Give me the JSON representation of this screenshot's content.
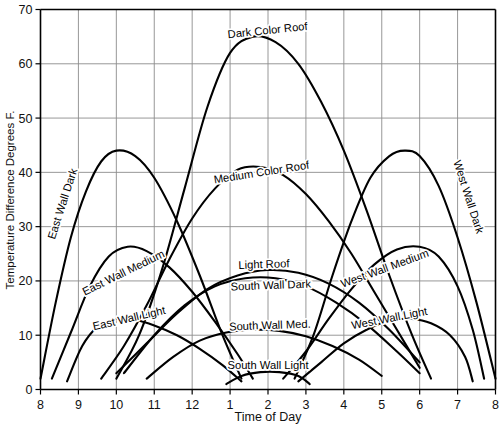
{
  "chart_data": {
    "type": "line",
    "title": "",
    "xlabel": "Time of Day",
    "ylabel": "Temperature Difference Degrees F.",
    "xlim": [
      8,
      20
    ],
    "ylim": [
      0,
      70
    ],
    "grid": true,
    "legend": "inline-curve-labels",
    "x_tick_labels": [
      "8",
      "9",
      "10",
      "11",
      "12",
      "1",
      "2",
      "3",
      "4",
      "5",
      "6",
      "7",
      "8"
    ],
    "x_tick_values": [
      8,
      9,
      10,
      11,
      12,
      13,
      14,
      15,
      16,
      17,
      18,
      19,
      20
    ],
    "y_tick_labels": [
      "0",
      "10",
      "20",
      "30",
      "40",
      "50",
      "60",
      "70"
    ],
    "y_tick_values": [
      0,
      10,
      20,
      30,
      40,
      50,
      60,
      70
    ],
    "series": [
      {
        "name": "Dark Color Roof",
        "label": "Dark Color Roof",
        "x": [
          10.0,
          10.6,
          11.2,
          11.8,
          12.4,
          13.0,
          13.6,
          14.2,
          14.8,
          15.4,
          16.0,
          16.6,
          17.2,
          17.8,
          18.3
        ],
        "values": [
          2.0,
          10.0,
          22.0,
          37.0,
          52.0,
          62.0,
          65.0,
          64.0,
          60.0,
          53.0,
          44.0,
          33.0,
          21.0,
          10.0,
          2.0
        ]
      },
      {
        "name": "Medium Color Roof",
        "label": "Medium Color Roof",
        "x": [
          9.6,
          10.2,
          10.8,
          11.4,
          12.0,
          12.6,
          13.2,
          13.8,
          14.4,
          15.0,
          15.6,
          16.2,
          16.8,
          17.4,
          18.0
        ],
        "values": [
          2.0,
          8.0,
          15.5,
          24.0,
          31.5,
          37.0,
          40.5,
          41.0,
          39.5,
          36.0,
          31.0,
          25.0,
          18.0,
          11.0,
          4.0
        ]
      },
      {
        "name": "Light Roof",
        "label": "Light Roof",
        "x": [
          10.0,
          10.8,
          11.6,
          12.4,
          13.2,
          14.0,
          14.8,
          15.6,
          16.4,
          17.2,
          18.0
        ],
        "values": [
          3.0,
          8.5,
          14.0,
          18.5,
          21.0,
          22.0,
          21.5,
          19.5,
          16.0,
          11.0,
          5.0
        ]
      },
      {
        "name": "East Wall Dark",
        "label": "East Wall Dark",
        "x": [
          8.0,
          8.4,
          8.8,
          9.2,
          9.6,
          10.0,
          10.5,
          11.0,
          11.6,
          12.2,
          12.8,
          13.3
        ],
        "values": [
          2.0,
          16.0,
          28.0,
          36.5,
          42.0,
          44.0,
          43.0,
          39.0,
          31.0,
          21.0,
          10.0,
          2.0
        ]
      },
      {
        "name": "East Wall Medium",
        "label": "East Wall Medium",
        "x": [
          8.3,
          8.8,
          9.3,
          9.8,
          10.3,
          10.8,
          11.4,
          12.0,
          12.6,
          13.2,
          13.6
        ],
        "values": [
          2.0,
          10.5,
          19.0,
          24.5,
          26.3,
          25.5,
          22.5,
          18.0,
          12.5,
          6.5,
          2.0
        ]
      },
      {
        "name": "East Wall Light",
        "label": "East Wall Light",
        "x": [
          8.7,
          9.1,
          9.5,
          10.0,
          10.5,
          11.0,
          11.6,
          12.2,
          12.8,
          13.3
        ],
        "values": [
          1.5,
          8.0,
          11.5,
          13.0,
          12.8,
          11.8,
          10.0,
          7.5,
          4.5,
          1.5
        ]
      },
      {
        "name": "South Wall Dark",
        "label": "South Wall Dark",
        "x": [
          10.2,
          11.0,
          11.8,
          12.6,
          13.4,
          14.2,
          15.0,
          15.8,
          16.6,
          17.4,
          18.0
        ],
        "values": [
          3.0,
          10.0,
          15.5,
          19.0,
          20.5,
          20.5,
          19.0,
          16.0,
          12.0,
          7.0,
          3.0
        ]
      },
      {
        "name": "South Wall Med.",
        "label": "South Wall Med.",
        "x": [
          10.8,
          11.5,
          12.2,
          12.9,
          13.6,
          14.3,
          15.0,
          15.7,
          16.4,
          17.0
        ],
        "values": [
          2.0,
          6.0,
          9.0,
          10.5,
          11.0,
          10.8,
          9.8,
          8.0,
          5.5,
          2.5
        ]
      },
      {
        "name": "South Wall Light",
        "label": "South Wall Light",
        "x": [
          12.9,
          13.3,
          13.8,
          14.3,
          14.8,
          15.1
        ],
        "values": [
          1.0,
          2.5,
          3.2,
          3.2,
          2.5,
          1.0
        ]
      },
      {
        "name": "West Wall Dark",
        "label": "West Wall Dark",
        "x": [
          14.7,
          15.2,
          15.7,
          16.2,
          16.7,
          17.2,
          17.6,
          18.0,
          18.5,
          19.0,
          19.5,
          20.0
        ],
        "values": [
          2.0,
          10.0,
          21.0,
          31.0,
          39.0,
          43.0,
          44.0,
          43.0,
          37.5,
          28.0,
          16.0,
          2.0
        ]
      },
      {
        "name": "West Wall Medium",
        "label": "West Wall Medium",
        "x": [
          14.4,
          15.0,
          15.6,
          16.2,
          16.8,
          17.4,
          18.0,
          18.5,
          19.0,
          19.4,
          19.7
        ],
        "values": [
          2.0,
          7.0,
          13.0,
          18.5,
          23.0,
          25.8,
          26.3,
          24.5,
          19.0,
          11.0,
          2.0
        ]
      },
      {
        "name": "West Wall Light",
        "label": "West Wall Light",
        "x": [
          14.8,
          15.4,
          16.0,
          16.6,
          17.2,
          17.8,
          18.3,
          18.8,
          19.2,
          19.4
        ],
        "values": [
          1.5,
          5.0,
          8.5,
          11.0,
          12.7,
          13.0,
          12.2,
          10.0,
          6.0,
          1.5
        ]
      }
    ],
    "curve_labels": [
      {
        "text": "Dark Color Roof",
        "x": 268,
        "y": 34,
        "rotate": -6,
        "anchor": "middle"
      },
      {
        "text": "Medium Color Roof",
        "x": 262,
        "y": 176,
        "rotate": -9,
        "anchor": "middle"
      },
      {
        "text": "Light Roof",
        "x": 264,
        "y": 268,
        "rotate": -2,
        "anchor": "middle"
      },
      {
        "text": "East Wall Dark",
        "x": 66,
        "y": 205,
        "rotate": -72,
        "anchor": "middle"
      },
      {
        "text": "East Wall Medium",
        "x": 125,
        "y": 276,
        "rotate": -26,
        "anchor": "middle"
      },
      {
        "text": "East Wall Light",
        "x": 130,
        "y": 322,
        "rotate": -13,
        "anchor": "middle"
      },
      {
        "text": "South Wall Dark",
        "x": 271,
        "y": 289,
        "rotate": -2,
        "anchor": "middle"
      },
      {
        "text": "South Wall Med.",
        "x": 270,
        "y": 329,
        "rotate": -2,
        "anchor": "middle"
      },
      {
        "text": "South Wall Light",
        "x": 268,
        "y": 369,
        "rotate": 0,
        "anchor": "middle"
      },
      {
        "text": "West Wall Dark",
        "x": 465,
        "y": 198,
        "rotate": 72,
        "anchor": "middle"
      },
      {
        "text": "West Wall Medium",
        "x": 386,
        "y": 272,
        "rotate": -20,
        "anchor": "middle"
      },
      {
        "text": "West Wall Light",
        "x": 390,
        "y": 322,
        "rotate": -11,
        "anchor": "middle"
      }
    ],
    "colors": {
      "curve": "#000000",
      "grid": "#8c8c8c",
      "axis": "#000000",
      "background": "#ffffff"
    }
  }
}
